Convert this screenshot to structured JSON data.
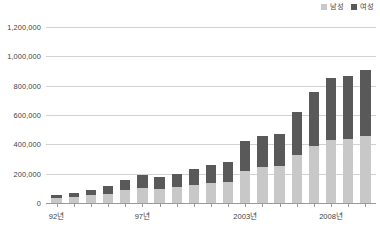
{
  "legend": {
    "position": "top-right",
    "entries": [
      {
        "label": "남성",
        "color": "#c8c8c8",
        "icon": "square-swatch-icon"
      },
      {
        "label": "여성",
        "color": "#595959",
        "icon": "square-swatch-icon"
      }
    ]
  },
  "colors": {
    "male": "#c8c8c8",
    "female": "#595959",
    "gridline": "#d2d2d2",
    "axis": "#9a9a9a",
    "text": "#3f3f3f",
    "background": "#ffffff"
  },
  "axis": {
    "y_ticks": [
      "1,200,000",
      "1,000,000",
      "800,000",
      "600,000",
      "400,000",
      "200,000",
      "0"
    ],
    "x_labels": [
      "92년",
      "97년",
      "2003년",
      "2008년"
    ],
    "x_label_slots": [
      0,
      5,
      11,
      16
    ]
  },
  "chart_data": {
    "type": "bar",
    "subtype": "stacked-column",
    "title": "",
    "subtitle": "",
    "xlabel": "",
    "ylabel": "",
    "ylim": [
      0,
      1200000
    ],
    "ytick_step": 200000,
    "grid": true,
    "legend_position": "top-right",
    "categories": [
      "92년",
      "",
      "",
      "",
      "",
      "97년",
      "",
      "",
      "",
      "",
      "",
      "2003년",
      "",
      "",
      "",
      "",
      "2008년",
      "",
      ""
    ],
    "series": [
      {
        "name": "남성",
        "color": "#c8c8c8",
        "values": [
          34000,
          40000,
          52000,
          62000,
          88000,
          105000,
          95000,
          112000,
          124000,
          134000,
          140000,
          220000,
          248000,
          252000,
          330000,
          392000,
          432000,
          436000,
          460000
        ]
      },
      {
        "name": "여성",
        "color": "#595959",
        "values": [
          24000,
          28000,
          36000,
          54000,
          70000,
          85000,
          80000,
          88000,
          110000,
          122000,
          140000,
          205000,
          207000,
          218000,
          290000,
          368000,
          418000,
          428000,
          450000
        ]
      }
    ],
    "totals": [
      58000,
      68000,
      88000,
      116000,
      158000,
      190000,
      175000,
      200000,
      234000,
      256000,
      280000,
      425000,
      455000,
      470000,
      620000,
      760000,
      850000,
      864000,
      910000
    ]
  }
}
